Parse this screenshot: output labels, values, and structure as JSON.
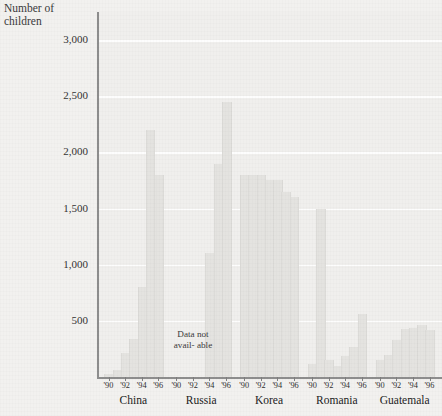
{
  "chart_data": {
    "type": "bar",
    "title": "Number of children",
    "xlabel": "",
    "ylabel": "Number of children",
    "ylim": [
      0,
      3250
    ],
    "grid": true,
    "legend": "none",
    "yticks": [
      500,
      1000,
      1500,
      2000,
      2500,
      3000
    ],
    "ytick_labels": [
      "500",
      "1,000",
      "1,500",
      "2,000",
      "2,500",
      "3,000"
    ],
    "x": [
      "'90",
      "'91",
      "'92",
      "'93",
      "'94",
      "'95",
      "'96"
    ],
    "xtick_labels": [
      "'90",
      "'92",
      "'94",
      "'96"
    ],
    "annotation": "The national origin of adopted children depends more on the politics and economics of the original nation than on any international determination of which children most need new homes.",
    "no_data_note": "Data not avail- able",
    "groups": [
      {
        "name": "China",
        "categories": [
          "'90",
          "'91",
          "'92",
          "'93",
          "'94",
          "'95",
          "'96"
        ],
        "values": [
          30,
          60,
          210,
          340,
          800,
          2200,
          1800
        ]
      },
      {
        "name": "Russia",
        "categories": [
          "'90",
          "'91",
          "'92",
          "'93",
          "'94",
          "'95",
          "'96"
        ],
        "values": [
          0,
          0,
          0,
          0,
          1100,
          1900,
          2450
        ],
        "note": "Data not available"
      },
      {
        "name": "Korea",
        "categories": [
          "'90",
          "'91",
          "'92",
          "'93",
          "'94",
          "'95",
          "'96"
        ],
        "values": [
          1800,
          1800,
          1800,
          1750,
          1750,
          1650,
          1600
        ]
      },
      {
        "name": "Romania",
        "categories": [
          "'90",
          "'91",
          "'92",
          "'93",
          "'94",
          "'95",
          "'96"
        ],
        "values": [
          120,
          1500,
          150,
          100,
          190,
          270,
          560
        ]
      },
      {
        "name": "Guatemala",
        "categories": [
          "'90",
          "'91",
          "'92",
          "'93",
          "'94",
          "'95",
          "'96"
        ],
        "values": [
          150,
          200,
          330,
          430,
          440,
          460,
          420
        ]
      }
    ]
  },
  "axis_title": "Number of\nchildren"
}
